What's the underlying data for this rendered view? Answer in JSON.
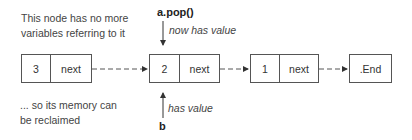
{
  "annotations": {
    "orphan_note_line1": "This node has no more",
    "orphan_note_line2": "variables referring to it",
    "reclaim_note_line1": "... so its memory can",
    "reclaim_note_line2": "be reclaimed",
    "top_pointer_label": "a.pop()",
    "top_pointer_caption": "now has value",
    "bottom_pointer_label": "b",
    "bottom_pointer_caption": "has value"
  },
  "nodes": [
    {
      "value": "3",
      "next": "next"
    },
    {
      "value": "2",
      "next": "next"
    },
    {
      "value": "1",
      "next": "next"
    }
  ],
  "terminal": {
    "label": ".End"
  },
  "colors": {
    "line": "#555555",
    "text": "#333333",
    "background": "#ffffff"
  }
}
